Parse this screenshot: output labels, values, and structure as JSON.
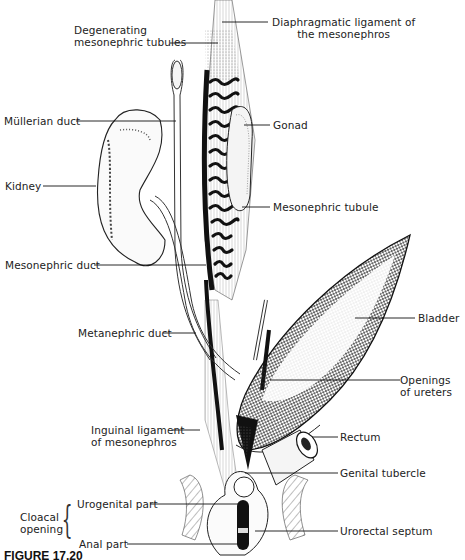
{
  "figure": {
    "caption": "FIGURE 17.20",
    "labels": {
      "degenerating_tubules": [
        "Degenerating",
        "mesonephric tubules"
      ],
      "diaphragmatic_ligament": [
        "Diaphragmatic ligament of",
        "the mesonephros"
      ],
      "mullerian_duct": "Müllerian duct",
      "gonad": "Gonad",
      "kidney": "Kidney",
      "mesonephric_tubule": "Mesonephric tubule",
      "mesonephric_duct": "Mesonephric duct",
      "bladder": "Bladder",
      "metanephric_duct": "Metanephric duct",
      "openings_ureters": [
        "Openings",
        "of ureters"
      ],
      "inguinal_ligament": [
        "Inguinal ligament",
        "of mesonephros"
      ],
      "rectum": "Rectum",
      "genital_tubercle": "Genital tubercle",
      "cloacal_opening": [
        "Cloacal",
        "opening"
      ],
      "urogenital_part": "Urogenital part",
      "urorectal_septum": "Urorectal septum",
      "anal_part": "Anal part"
    },
    "colors": {
      "ink": "#1a1a1a",
      "background": "#ffffff",
      "stipple": "#555555"
    }
  }
}
